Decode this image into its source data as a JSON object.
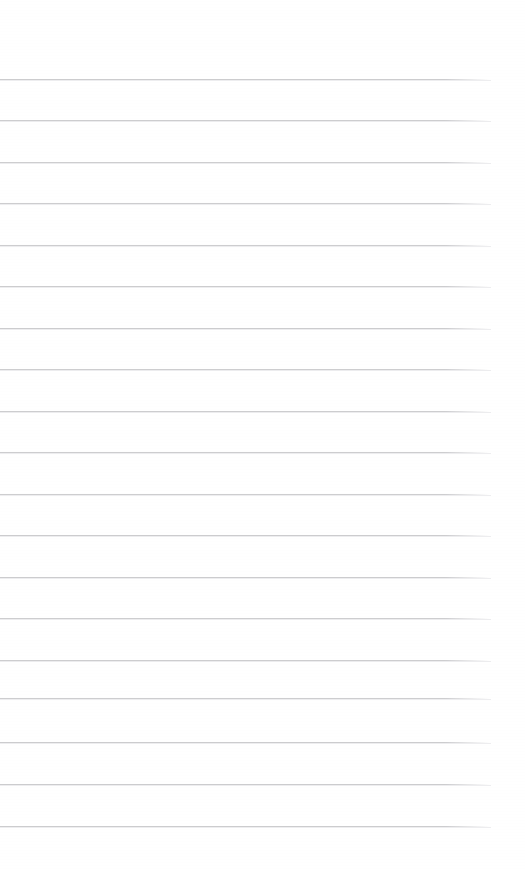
{
  "document": {
    "kind": "scanned-ruled-page",
    "description": "Blank scanned sheet of ruled notebook paper",
    "page_width": 525,
    "page_height": 869,
    "background_color": "#ffffff",
    "has_text": false,
    "has_handwriting": false,
    "has_margin_rule": false,
    "has_header": false,
    "has_footer": false,
    "visible_text": ""
  },
  "ruling": {
    "line_color": "#c9c9cc",
    "line_secondary_color": "#e4e4e7",
    "line_thickness_px": 1,
    "line_count": 19,
    "line_spacing_px": 41.5,
    "first_line_y": 79,
    "last_line_y": 826,
    "line_start_x": 0,
    "line_end_x": 491,
    "top_margin_px": 79,
    "bottom_margin_px": 43,
    "right_margin_px": 34,
    "lines": [
      {
        "index": 1,
        "y": 79,
        "x_start": 0,
        "x_end": 491
      },
      {
        "index": 2,
        "y": 120,
        "x_start": 0,
        "x_end": 491
      },
      {
        "index": 3,
        "y": 162,
        "x_start": 0,
        "x_end": 491
      },
      {
        "index": 4,
        "y": 203,
        "x_start": 0,
        "x_end": 491
      },
      {
        "index": 5,
        "y": 245,
        "x_start": 0,
        "x_end": 491
      },
      {
        "index": 6,
        "y": 286,
        "x_start": 0,
        "x_end": 491
      },
      {
        "index": 7,
        "y": 328,
        "x_start": 0,
        "x_end": 491
      },
      {
        "index": 8,
        "y": 369,
        "x_start": 0,
        "x_end": 491
      },
      {
        "index": 9,
        "y": 411,
        "x_start": 0,
        "x_end": 491
      },
      {
        "index": 10,
        "y": 452,
        "x_start": 0,
        "x_end": 491
      },
      {
        "index": 11,
        "y": 494,
        "x_start": 0,
        "x_end": 491
      },
      {
        "index": 12,
        "y": 535,
        "x_start": 0,
        "x_end": 491
      },
      {
        "index": 13,
        "y": 577,
        "x_start": 0,
        "x_end": 491
      },
      {
        "index": 14,
        "y": 618,
        "x_start": 0,
        "x_end": 491
      },
      {
        "index": 15,
        "y": 660,
        "x_start": 0,
        "x_end": 491
      },
      {
        "index": 16,
        "y": 698,
        "x_start": 0,
        "x_end": 491
      },
      {
        "index": 17,
        "y": 742,
        "x_start": 0,
        "x_end": 491
      },
      {
        "index": 18,
        "y": 784,
        "x_start": 0,
        "x_end": 491
      },
      {
        "index": 19,
        "y": 826,
        "x_start": 0,
        "x_end": 491
      }
    ]
  }
}
